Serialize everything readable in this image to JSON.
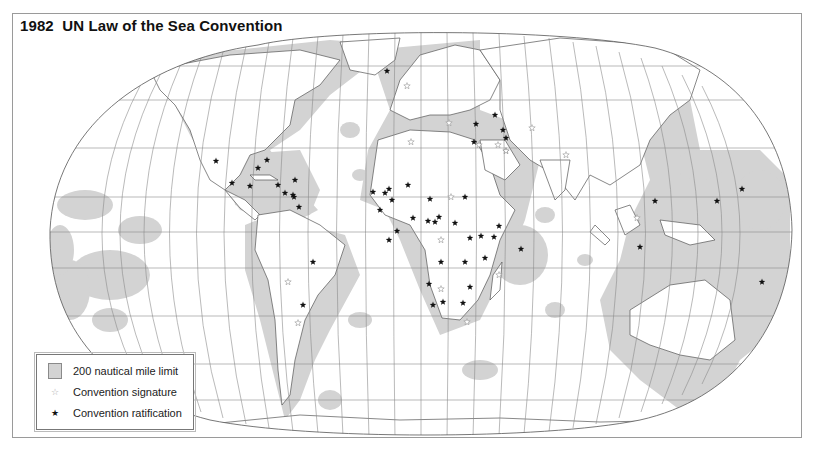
{
  "title": "1982  UN Law of the Sea Convention",
  "legend": {
    "items": [
      {
        "symbol": "gray-swatch",
        "label": "200 nautical mile limit"
      },
      {
        "symbol": "open-star",
        "label": "Convention signature"
      },
      {
        "symbol": "filled-star",
        "label": "Convention ratification"
      }
    ]
  },
  "colors": {
    "eez": "#d3d3d3",
    "land": "#ffffff",
    "graticule": "#8c8c8c",
    "border": "#777777",
    "ratification": "#111111",
    "signature": "#a0a0a0"
  },
  "ratification_markers": [
    [
      216,
      161
    ],
    [
      267,
      160
    ],
    [
      258,
      168
    ],
    [
      232,
      183
    ],
    [
      250,
      186
    ],
    [
      278,
      185
    ],
    [
      295,
      180
    ],
    [
      293,
      195
    ],
    [
      285,
      193
    ],
    [
      294,
      197
    ],
    [
      299,
      207
    ],
    [
      387,
      71
    ],
    [
      373,
      192
    ],
    [
      385,
      193
    ],
    [
      389,
      189
    ],
    [
      392,
      200
    ],
    [
      380,
      210
    ],
    [
      408,
      185
    ],
    [
      389,
      240
    ],
    [
      397,
      231
    ],
    [
      413,
      218
    ],
    [
      428,
      221
    ],
    [
      439,
      217
    ],
    [
      435,
      222
    ],
    [
      430,
      199
    ],
    [
      465,
      197
    ],
    [
      474,
      142
    ],
    [
      476,
      124
    ],
    [
      495,
      115
    ],
    [
      503,
      130
    ],
    [
      506,
      138
    ],
    [
      506,
      151
    ],
    [
      465,
      262
    ],
    [
      441,
      262
    ],
    [
      455,
      223
    ],
    [
      470,
      238
    ],
    [
      481,
      236
    ],
    [
      494,
      237
    ],
    [
      485,
      258
    ],
    [
      499,
      226
    ],
    [
      521,
      249
    ],
    [
      433,
      305
    ],
    [
      429,
      284
    ],
    [
      443,
      302
    ],
    [
      463,
      303
    ],
    [
      470,
      287
    ],
    [
      313,
      262
    ],
    [
      303,
      305
    ],
    [
      655,
      201
    ],
    [
      717,
      201
    ],
    [
      742,
      189
    ],
    [
      640,
      247
    ],
    [
      762,
      282
    ]
  ],
  "signature_markers": [
    [
      407,
      86
    ],
    [
      449,
      123
    ],
    [
      479,
      145
    ],
    [
      498,
      145
    ],
    [
      506,
      151
    ],
    [
      451,
      197
    ],
    [
      441,
      240
    ],
    [
      499,
      275
    ],
    [
      566,
      155
    ],
    [
      441,
      289
    ],
    [
      637,
      218
    ],
    [
      467,
      322
    ],
    [
      288,
      282
    ],
    [
      298,
      323
    ],
    [
      411,
      142
    ],
    [
      532,
      128
    ]
  ]
}
